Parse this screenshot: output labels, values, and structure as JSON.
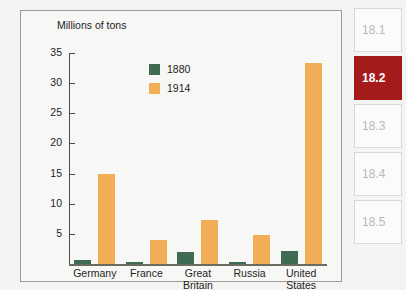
{
  "chart_data": {
    "type": "bar",
    "title": "",
    "ylabel": "Millions of tons",
    "xlabel": "",
    "ylim": [
      0,
      36
    ],
    "yticks": [
      5,
      10,
      15,
      20,
      25,
      30,
      35
    ],
    "grid": false,
    "legend_position": "upper-center",
    "categories": [
      "Germany",
      "France",
      "Great Britain",
      "Russia",
      "United States"
    ],
    "category_lines": [
      [
        "Germany"
      ],
      [
        "France"
      ],
      [
        "Great",
        "Britain"
      ],
      [
        "Russia"
      ],
      [
        "United",
        "States"
      ]
    ],
    "series": [
      {
        "name": "1880",
        "color": "#3f6b53",
        "values": [
          0.7,
          0.4,
          2.0,
          0.4,
          2.2
        ]
      },
      {
        "name": "1914",
        "color": "#f2ae57",
        "values": [
          15.0,
          4.0,
          7.3,
          4.8,
          33.3
        ]
      }
    ]
  },
  "sidebar": {
    "tabs": [
      {
        "label": "18.1",
        "active": false
      },
      {
        "label": "18.2",
        "active": true
      },
      {
        "label": "18.3",
        "active": false
      },
      {
        "label": "18.4",
        "active": false
      },
      {
        "label": "18.5",
        "active": false
      }
    ]
  },
  "colors": {
    "series_1880": "#3f6b53",
    "series_1914": "#f2ae57",
    "active_tab": "#a51a1a",
    "inactive_tab_text": "#b9b9b9",
    "panel_background": "#f7f7f5",
    "panel_border": "#9a9a9a",
    "axis": "#4a4a4a"
  }
}
